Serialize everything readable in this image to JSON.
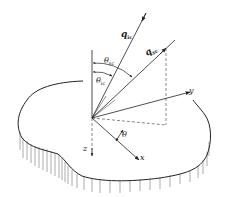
{
  "diagram": {
    "type": "scattering-geometry",
    "labels": {
      "q_incident": {
        "main": "q",
        "sub": "ic"
      },
      "q_scattered": {
        "main": "q",
        "sub": "sc"
      },
      "theta_scattered": {
        "main": "θ",
        "sub": "sc"
      },
      "theta_incident": {
        "main": "θ",
        "sub": "ic"
      },
      "theta": "θ",
      "axis_x": "x",
      "axis_y": "y",
      "axis_z": "z"
    },
    "colors": {
      "line": "#222222",
      "dashed": "#555555",
      "background": "#ffffff"
    }
  }
}
